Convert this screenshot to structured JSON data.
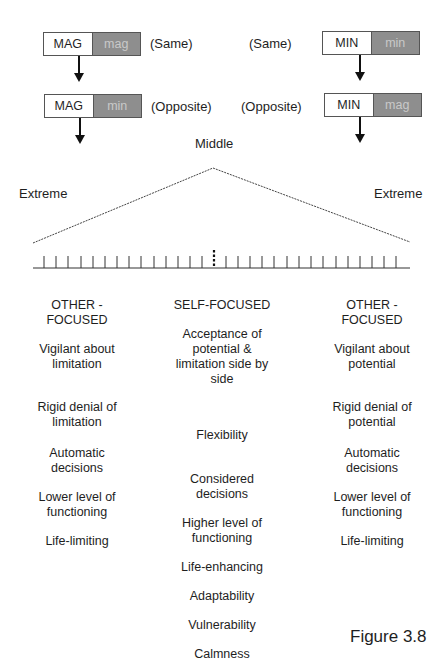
{
  "top_left": {
    "box1": {
      "left": "MAG",
      "right": "mag"
    },
    "box1_note": "(Same)",
    "box2": {
      "left": "MAG",
      "right": "min"
    },
    "box2_note": "(Opposite)"
  },
  "top_right": {
    "box1": {
      "left": "MIN",
      "right": "min"
    },
    "box1_note": "(Same)",
    "box2": {
      "left": "MIN",
      "right": "mag"
    },
    "box2_note": "(Opposite)"
  },
  "scale": {
    "middle_label": "Middle",
    "left_extreme_label": "Extreme",
    "right_extreme_label": "Extreme",
    "tick_count_left": 15,
    "tick_count_right": 15
  },
  "columns": {
    "left": {
      "heading": "OTHER -\nFOCUSED",
      "items": [
        "Vigilant about limitation",
        "Rigid denial of limitation",
        "Automatic decisions",
        "Lower level of functioning",
        "Life-limiting"
      ]
    },
    "center": {
      "heading": "SELF-FOCUSED",
      "items": [
        "Acceptance of potential & limitation side by side",
        "Flexibility",
        "Considered decisions",
        "Higher level of functioning",
        "Life-enhancing",
        "Adaptability",
        "Vulnerability",
        "Calmness"
      ]
    },
    "right": {
      "heading": "OTHER -\nFOCUSED",
      "items": [
        "Vigilant about potential",
        "Rigid denial of potential",
        "Automatic decisions",
        "Lower level of functioning",
        "Life-limiting"
      ]
    }
  },
  "caption": "Figure 3.8",
  "colors": {
    "shaded_box": "#8e8e8e",
    "shaded_text": "#c9c9c9",
    "line": "#333333"
  }
}
